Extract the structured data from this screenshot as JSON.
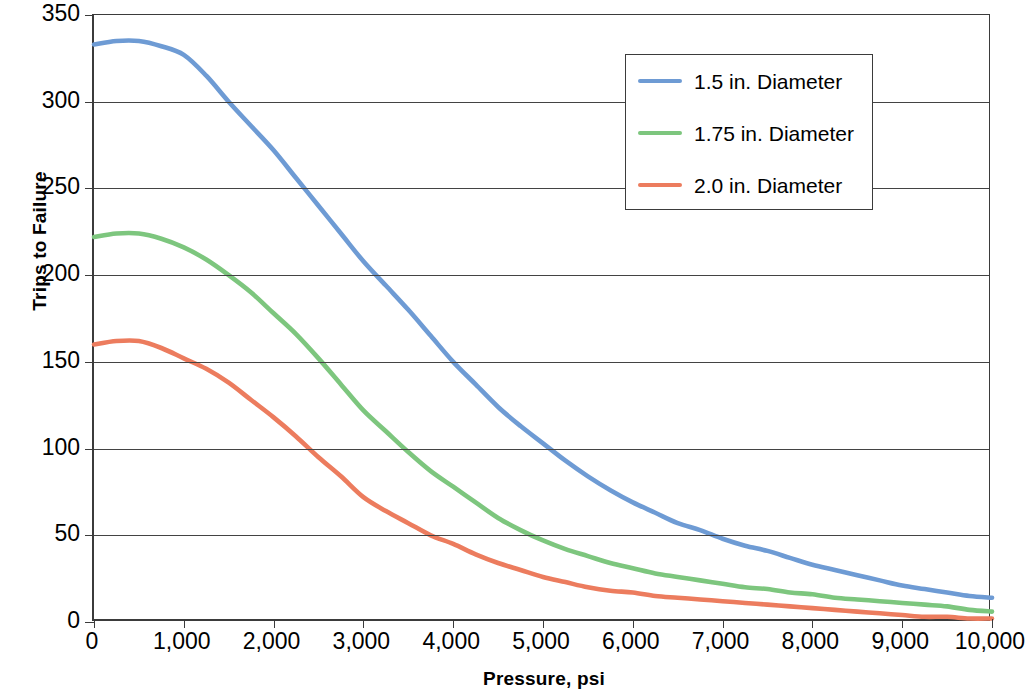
{
  "chart_data": {
    "type": "line",
    "title": "",
    "xlabel": "Pressure, psi",
    "ylabel": "Trips to Failure",
    "xlim": [
      0,
      10000
    ],
    "ylim": [
      0,
      350
    ],
    "grid": true,
    "legend_position": "top-right",
    "x_ticks": [
      "0",
      "1,000",
      "2,000",
      "3,000",
      "4,000",
      "5,000",
      "6,000",
      "7,000",
      "8,000",
      "9,000",
      "10,000"
    ],
    "x_tick_values": [
      0,
      1000,
      2000,
      3000,
      4000,
      5000,
      6000,
      7000,
      8000,
      9000,
      10000
    ],
    "y_ticks": [
      "0",
      "50",
      "100",
      "150",
      "200",
      "250",
      "300",
      "350"
    ],
    "y_tick_values": [
      0,
      50,
      100,
      150,
      200,
      250,
      300,
      350
    ],
    "x": [
      0,
      250,
      500,
      750,
      1000,
      1250,
      1500,
      1750,
      2000,
      2250,
      2500,
      2750,
      3000,
      3250,
      3500,
      3750,
      4000,
      4250,
      4500,
      4750,
      5000,
      5250,
      5500,
      5750,
      6000,
      6250,
      6500,
      6750,
      7000,
      7250,
      7500,
      7750,
      8000,
      8250,
      8500,
      8750,
      9000,
      9250,
      9500,
      9750,
      10000
    ],
    "series": [
      {
        "name": "1.5 in. Diameter",
        "color": "#6E9BD4",
        "values": [
          333,
          335,
          335,
          332,
          327,
          315,
          300,
          286,
          272,
          256,
          240,
          224,
          208,
          194,
          180,
          165,
          150,
          137,
          124,
          113,
          103,
          93,
          84,
          76,
          69,
          63,
          57,
          53,
          48,
          44,
          41,
          37,
          33,
          30,
          27,
          24,
          21,
          19,
          17,
          15,
          14
        ]
      },
      {
        "name": "1.75 in. Diameter",
        "color": "#7DC67E",
        "values": [
          222,
          224,
          224,
          221,
          216,
          209,
          200,
          190,
          178,
          166,
          152,
          137,
          122,
          110,
          98,
          87,
          78,
          69,
          60,
          53,
          47,
          42,
          38,
          34,
          31,
          28,
          26,
          24,
          22,
          20,
          19,
          17,
          16,
          14,
          13,
          12,
          11,
          10,
          9,
          7,
          6
        ]
      },
      {
        "name": "2.0 in. Diameter",
        "color": "#EC7C5E",
        "values": [
          160,
          162,
          162,
          158,
          152,
          146,
          138,
          128,
          118,
          107,
          95,
          84,
          72,
          64,
          57,
          50,
          45,
          39,
          34,
          30,
          26,
          23,
          20,
          18,
          17,
          15,
          14,
          13,
          12,
          11,
          10,
          9,
          8,
          7,
          6,
          5,
          4,
          3,
          3,
          2,
          2
        ]
      }
    ]
  },
  "legend": {
    "items": [
      {
        "label": "1.5 in. Diameter",
        "color": "#6E9BD4"
      },
      {
        "label": "1.75 in. Diameter",
        "color": "#7DC67E"
      },
      {
        "label": "2.0 in. Diameter",
        "color": "#EC7C5E"
      }
    ]
  },
  "axes": {
    "y_title": "Trips to Failure",
    "x_title": "Pressure, psi"
  }
}
